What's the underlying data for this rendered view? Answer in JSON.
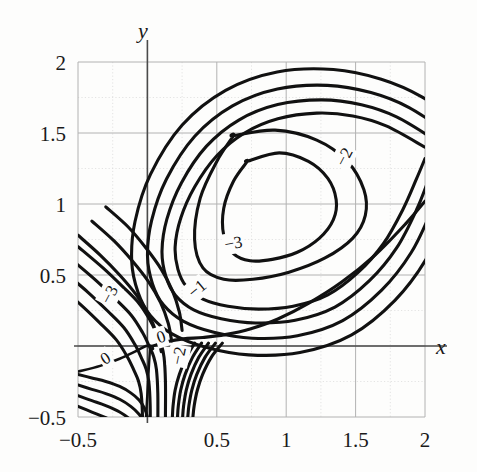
{
  "figure": {
    "kind": "contour-plot",
    "background": "#fdfdfc",
    "ink": "#111111",
    "grid_color": "#b9b9b9",
    "axis_color": "#555555"
  },
  "axes": {
    "x_name": "x",
    "y_name": "y",
    "x_range": [
      -0.5,
      2
    ],
    "y_range": [
      -0.5,
      2
    ],
    "x_ticks": [
      {
        "value": -0.5,
        "label": "−0.5"
      },
      {
        "value": 0.5,
        "label": "0.5"
      },
      {
        "value": 1,
        "label": "1"
      },
      {
        "value": 1.5,
        "label": "1.5"
      },
      {
        "value": 2,
        "label": "2"
      }
    ],
    "y_ticks": [
      {
        "value": 2,
        "label": "2"
      },
      {
        "value": 1.5,
        "label": "1.5"
      },
      {
        "value": 1,
        "label": "1"
      },
      {
        "value": 0.5,
        "label": "0.5"
      },
      {
        "value": -0.5,
        "label": "−0.5"
      }
    ],
    "grid": "on",
    "grid_major_step": 0.5,
    "grid_minor_step": 0.25
  },
  "chart_data": {
    "type": "line",
    "title": "",
    "subtitle": "",
    "xlabel": "x",
    "ylabel": "y",
    "xlim": [
      -0.5,
      2
    ],
    "ylim": [
      -0.5,
      2
    ],
    "grid": true,
    "legend": "none",
    "contour_levels": [
      0,
      -1,
      -2,
      -3
    ],
    "series": [
      {
        "name": "level -3",
        "level": -3,
        "label": "−3",
        "closed": true,
        "label_xy": [
          0.62,
          0.72
        ],
        "label_rotation": -10,
        "x": [
          0.72,
          0.95,
          1.16,
          1.3,
          1.36,
          1.34,
          1.24,
          1.08,
          0.9,
          0.74,
          0.62,
          0.55,
          0.55,
          0.62,
          0.72
        ],
        "y": [
          1.3,
          1.36,
          1.3,
          1.18,
          1.03,
          0.89,
          0.76,
          0.66,
          0.61,
          0.6,
          0.65,
          0.78,
          0.97,
          1.16,
          1.3
        ]
      },
      {
        "name": "level -2",
        "level": -2,
        "label": "−2",
        "closed": true,
        "label_xy": [
          1.42,
          1.33
        ],
        "label_rotation": -62,
        "x": [
          0.62,
          0.92,
          1.22,
          1.44,
          1.56,
          1.57,
          1.48,
          1.28,
          1.02,
          0.76,
          0.55,
          0.4,
          0.34,
          0.38,
          0.5,
          0.62
        ],
        "y": [
          1.48,
          1.52,
          1.45,
          1.3,
          1.1,
          0.92,
          0.76,
          0.62,
          0.52,
          0.47,
          0.47,
          0.55,
          0.75,
          1.04,
          1.3,
          1.48
        ]
      },
      {
        "name": "level -1",
        "level": -1,
        "label": "−1",
        "closed": false,
        "label_xy": [
          0.36,
          0.4
        ],
        "label_rotation": -40,
        "x": [
          2.0,
          1.72,
          1.48,
          1.22,
          0.94,
          0.7,
          0.5,
          0.34,
          0.24,
          0.2,
          0.22,
          0.28,
          0.4,
          0.58,
          0.8,
          1.05,
          1.3,
          1.52,
          1.7,
          1.84,
          1.94,
          2.0
        ],
        "y": [
          1.4,
          1.55,
          1.62,
          1.64,
          1.6,
          1.5,
          1.34,
          1.12,
          0.9,
          0.7,
          0.54,
          0.42,
          0.33,
          0.28,
          0.26,
          0.28,
          0.36,
          0.52,
          0.72,
          0.96,
          1.18,
          1.32
        ]
      },
      {
        "name": "level -1 outer",
        "level": -1,
        "label": "",
        "closed": false,
        "label_xy": [
          0.1,
          0.47
        ],
        "label_rotation": -55,
        "x": [
          -0.5,
          -0.32,
          -0.18,
          -0.06,
          0.02,
          0.07,
          0.1,
          0.12,
          0.13,
          0.13
        ],
        "y": [
          0.7,
          0.55,
          0.42,
          0.3,
          0.18,
          0.08,
          0.01,
          -0.08,
          -0.25,
          -0.5
        ]
      },
      {
        "name": "level 0 left",
        "level": 0,
        "label": "0",
        "closed": false,
        "label_xy": [
          -0.3,
          -0.09
        ],
        "label_rotation": -32,
        "x": [
          -0.5,
          -0.34,
          -0.2,
          -0.09,
          -0.01,
          0.03,
          0.04
        ],
        "y": [
          -0.18,
          -0.14,
          -0.09,
          -0.04,
          0.0,
          0.0,
          -0.02
        ]
      },
      {
        "name": "level 0 right",
        "level": 0,
        "label": "0",
        "closed": false,
        "label_xy": [
          0.1,
          0.06
        ],
        "label_rotation": -18,
        "x": [
          0.04,
          0.14,
          0.26,
          0.4,
          0.56,
          0.74,
          0.94,
          1.16,
          1.4,
          1.64,
          1.86,
          2.0
        ],
        "y": [
          0.0,
          0.03,
          0.05,
          0.06,
          0.08,
          0.12,
          0.19,
          0.3,
          0.45,
          0.64,
          0.86,
          1.02
        ]
      },
      {
        "name": "level 0 branch",
        "level": 0,
        "label": "−2",
        "closed": false,
        "label_xy": [
          0.23,
          -0.07
        ],
        "label_rotation": -78,
        "x": [
          0.3,
          0.26,
          0.22,
          0.19,
          0.17,
          0.16,
          0.16
        ],
        "y": [
          -0.05,
          -0.14,
          -0.25,
          -0.34,
          -0.42,
          -0.47,
          -0.5
        ]
      },
      {
        "name": "level -3 left branch",
        "level": -3,
        "label": "−3",
        "closed": false,
        "label_xy": [
          -0.27,
          0.36
        ],
        "label_rotation": -62,
        "x": [
          -0.5,
          -0.36,
          -0.24,
          -0.14,
          -0.06,
          0.0,
          0.04,
          0.06
        ],
        "y": [
          0.52,
          0.4,
          0.28,
          0.16,
          0.06,
          -0.02,
          -0.14,
          -0.3
        ]
      }
    ],
    "annotations": [
      {
        "text": "−3",
        "x": 0.62,
        "y": 0.72
      },
      {
        "text": "−2",
        "x": 1.42,
        "y": 1.33
      },
      {
        "text": "−1",
        "x": 0.36,
        "y": 0.4
      },
      {
        "text": "−1",
        "x": -0.17,
        "y": 0.22
      },
      {
        "text": "−3",
        "x": -0.27,
        "y": 0.38
      },
      {
        "text": "0",
        "x": 0.1,
        "y": 0.07
      },
      {
        "text": "0",
        "x": -0.28,
        "y": -0.11
      },
      {
        "text": "−2",
        "x": 0.24,
        "y": -0.06
      }
    ]
  },
  "contour_label_texts": {
    "m3": "−3",
    "m2": "−2",
    "m1": "−1",
    "zero": "0"
  }
}
